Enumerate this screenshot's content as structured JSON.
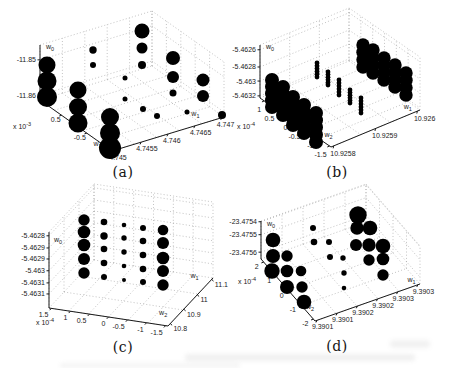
{
  "figure": {
    "background": "#ffffff",
    "marker": "filled-circle",
    "marker_color": "#000000"
  },
  "colors": {
    "dot": "#000000",
    "axis": "#1a1a1a",
    "grid": "#9a9a9a",
    "text": "#1a1a1a"
  },
  "chart_data": [
    {
      "id": "a",
      "type": "scatter",
      "style": "3d-bubble",
      "caption": "(a)",
      "axes": {
        "w0": {
          "base": "w",
          "sub": "0",
          "ticks": [
            {
              "text": "-11.85",
              "t": 0.27
            },
            {
              "text": "-11.86",
              "t": 0.91
            }
          ]
        },
        "w1": {
          "base": "w",
          "sub": "1",
          "ticks": [
            {
              "text": "4.745",
              "t": 0.02
            },
            {
              "text": "4.7455",
              "t": 0.26
            },
            {
              "text": "4.746",
              "t": 0.5
            },
            {
              "text": "4.7465",
              "t": 0.74
            },
            {
              "text": "4.747",
              "t": 0.98
            }
          ]
        },
        "w2": {
          "base": "w",
          "sub": "2",
          "ticks": [
            {
              "text": "0.5",
              "t": 0.3
            },
            {
              "text": "-0.5",
              "t": 0.65
            }
          ],
          "exponent": {
            "text": "x 10",
            "power": "-3"
          }
        }
      },
      "points": [
        [
          142,
          31,
          7.5
        ],
        [
          142,
          48,
          5.5
        ],
        [
          142,
          65,
          4
        ],
        [
          93,
          50,
          3.7
        ],
        [
          93,
          65,
          3
        ],
        [
          173,
          58,
          7
        ],
        [
          173,
          77,
          6
        ],
        [
          173,
          93,
          3.5
        ],
        [
          203,
          80,
          6.5
        ],
        [
          203,
          96,
          6
        ],
        [
          47,
          65,
          8.5
        ],
        [
          47,
          81,
          9.5
        ],
        [
          47,
          97,
          10
        ],
        [
          78,
          90,
          8.5
        ],
        [
          78,
          107,
          9
        ],
        [
          78,
          123,
          9.5
        ],
        [
          110,
          117,
          9
        ],
        [
          110,
          133,
          10
        ],
        [
          110,
          148,
          11
        ],
        [
          125,
          78,
          2.5
        ],
        [
          125,
          99,
          2.5
        ],
        [
          143,
          109,
          3
        ],
        [
          157,
          116,
          3
        ],
        [
          187,
          112,
          2.5
        ],
        [
          222,
          115,
          4
        ]
      ],
      "columns": []
    },
    {
      "id": "b",
      "type": "scatter",
      "style": "3d-bubble-stacks",
      "caption": "(b)",
      "axes": {
        "w0": {
          "base": "w",
          "sub": "0",
          "ticks": [
            {
              "text": "-5.4626",
              "t": 0.09
            },
            {
              "text": "-5.4628",
              "t": 0.415
            },
            {
              "text": "-5.463",
              "t": 0.68
            },
            {
              "text": "-5.4632",
              "t": 0.96
            }
          ]
        },
        "w1": {
          "base": "w",
          "sub": "1",
          "ticks": [
            {
              "text": "10.9258",
              "t": 0.03
            },
            {
              "text": "10.9259",
              "t": 0.5
            },
            {
              "text": "10.926",
              "t": 0.97
            }
          ]
        },
        "w2": {
          "base": "w",
          "sub": "2",
          "ticks": [
            {
              "text": "1",
              "t": 0.06
            },
            {
              "text": "0.5",
              "t": 0.244
            },
            {
              "text": "0",
              "t": 0.428
            },
            {
              "text": "-0.5",
              "t": 0.612
            },
            {
              "text": "-1",
              "t": 0.796
            },
            {
              "text": "-1.5",
              "t": 0.98
            }
          ],
          "exponent": {
            "text": "x 10",
            "power": "-4"
          }
        }
      },
      "points": [],
      "columns": [
        [
          44,
          80,
          107,
          7,
          5
        ],
        [
          55,
          87,
          115,
          7,
          5
        ],
        [
          65,
          97,
          125,
          7,
          5
        ],
        [
          76,
          105,
          133,
          7,
          5
        ],
        [
          88,
          113,
          142,
          7,
          5
        ],
        [
          89,
          63,
          77,
          2.4,
          6
        ],
        [
          100,
          72,
          85,
          2.4,
          6
        ],
        [
          111,
          80,
          95,
          2.4,
          6
        ],
        [
          122,
          90,
          103,
          2.4,
          6
        ],
        [
          133,
          98,
          113,
          2.4,
          6
        ],
        [
          135,
          45,
          67,
          6.7,
          4
        ],
        [
          145,
          50,
          73,
          6.7,
          4
        ],
        [
          156,
          58,
          80,
          6.7,
          4
        ],
        [
          167,
          65,
          87,
          6.7,
          4
        ],
        [
          178,
          73,
          95,
          6.7,
          4
        ]
      ]
    },
    {
      "id": "c",
      "type": "scatter",
      "style": "3d-bubble",
      "caption": "(c)",
      "axes": {
        "w0": {
          "base": "w",
          "sub": "0",
          "ticks": [
            {
              "text": "-5.4628",
              "t": 0.05
            },
            {
              "text": "-5.4629",
              "t": 0.21
            },
            {
              "text": "-5.4629",
              "t": 0.355
            },
            {
              "text": "-5.463",
              "t": 0.51
            },
            {
              "text": "-5.4631",
              "t": 0.67
            },
            {
              "text": "-5.4631",
              "t": 0.815
            }
          ]
        },
        "w1": {
          "base": "w",
          "sub": "1",
          "ticks": [
            {
              "text": "10.8",
              "t": 0.05
            },
            {
              "text": "10.9",
              "t": 0.35
            },
            {
              "text": "11",
              "t": 0.65
            },
            {
              "text": "11.1",
              "t": 0.97
            }
          ]
        },
        "w2": {
          "base": "w",
          "sub": "2",
          "ticks": [
            {
              "text": "1.5",
              "t": 0.02
            },
            {
              "text": "1",
              "t": 0.18
            },
            {
              "text": "0.5",
              "t": 0.34
            },
            {
              "text": "0",
              "t": 0.5
            },
            {
              "text": "-0.5",
              "t": 0.66
            },
            {
              "text": "-1",
              "t": 0.82
            },
            {
              "text": "-1.5",
              "t": 0.98
            }
          ],
          "exponent": {
            "text": "x 10",
            "power": "-4"
          }
        }
      },
      "points": [
        [
          84,
          36,
          5.7
        ],
        [
          84,
          48,
          6.3
        ],
        [
          84,
          61,
          6.3
        ],
        [
          84,
          75,
          6
        ],
        [
          84,
          89,
          5.7
        ],
        [
          104,
          38,
          3.3
        ],
        [
          104,
          52,
          3.7
        ],
        [
          104,
          65,
          3.3
        ],
        [
          104,
          79,
          3.3
        ],
        [
          104,
          93,
          3
        ],
        [
          124,
          41,
          2.3
        ],
        [
          124,
          54,
          2.7
        ],
        [
          124,
          68,
          2.7
        ],
        [
          124,
          82,
          2.3
        ],
        [
          124,
          96,
          2
        ],
        [
          143,
          44,
          3
        ],
        [
          143,
          57,
          3.3
        ],
        [
          143,
          71,
          3.3
        ],
        [
          143,
          85,
          3.3
        ],
        [
          143,
          98,
          3
        ],
        [
          163,
          46,
          5.3
        ],
        [
          163,
          59,
          6
        ],
        [
          163,
          74,
          6.3
        ],
        [
          163,
          87,
          6
        ],
        [
          163,
          101,
          5.7
        ]
      ],
      "columns": []
    },
    {
      "id": "d",
      "type": "scatter",
      "style": "3d-bubble",
      "caption": "(d)",
      "axes": {
        "w0": {
          "base": "w",
          "sub": "0",
          "ticks": [
            {
              "text": "-23.4754",
              "t": 0.02
            },
            {
              "text": "-23.4755",
              "t": 0.36
            },
            {
              "text": "-23.4756",
              "t": 0.82
            }
          ]
        },
        "w1": {
          "base": "w",
          "sub": "1",
          "ticks": [
            {
              "text": "9.3901",
              "t": 0.02
            },
            {
              "text": "9.3901",
              "t": 0.212
            },
            {
              "text": "9.3902",
              "t": 0.404
            },
            {
              "text": "9.3902",
              "t": 0.596
            },
            {
              "text": "9.3903",
              "t": 0.788
            },
            {
              "text": "9.3903",
              "t": 0.98
            }
          ]
        },
        "w2": {
          "base": "w",
          "sub": "2",
          "ticks": [
            {
              "text": "2",
              "t": 0.05
            },
            {
              "text": "1",
              "t": 0.28
            },
            {
              "text": "0",
              "t": 0.51
            },
            {
              "text": "-1",
              "t": 0.74
            },
            {
              "text": "-2",
              "t": 0.97
            }
          ],
          "exponent": {
            "text": "x 10",
            "power": "-4"
          }
        }
      },
      "points": [
        [
          45,
          56,
          7.3
        ],
        [
          45,
          72,
          7
        ],
        [
          59,
          72,
          5.7
        ],
        [
          44,
          87,
          7.7
        ],
        [
          59,
          87,
          6.3
        ],
        [
          73,
          87,
          5.3
        ],
        [
          59,
          103,
          7
        ],
        [
          74,
          103,
          5.7
        ],
        [
          76,
          118,
          7.3
        ],
        [
          85,
          44,
          3
        ],
        [
          86,
          58,
          3.3
        ],
        [
          101,
          58,
          3
        ],
        [
          102,
          73,
          3
        ],
        [
          115,
          74,
          2.7
        ],
        [
          116,
          89,
          2.7
        ],
        [
          116,
          104,
          2.3
        ],
        [
          130,
          31,
          8.7
        ],
        [
          129,
          44,
          6.7
        ],
        [
          142,
          44,
          7.3
        ],
        [
          128,
          61,
          6
        ],
        [
          141,
          61,
          6.7
        ],
        [
          155,
          62,
          7.3
        ],
        [
          141,
          76,
          5.7
        ],
        [
          155,
          75,
          6.3
        ],
        [
          155,
          91,
          5.7
        ]
      ],
      "columns": []
    }
  ]
}
